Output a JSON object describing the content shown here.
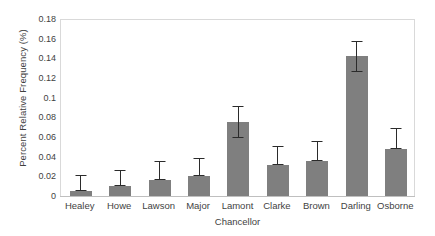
{
  "chart_data": {
    "type": "bar",
    "title": "",
    "xlabel": "Chancellor",
    "ylabel": "Percent Relative Frequency (%)",
    "categories": [
      "Healey",
      "Howe",
      "Lawson",
      "Major",
      "Lamont",
      "Clarke",
      "Brown",
      "Darling",
      "Osborne"
    ],
    "values": [
      0.005,
      0.01,
      0.016,
      0.02,
      0.075,
      0.032,
      0.036,
      0.142,
      0.048
    ],
    "error_low": [
      0.005,
      0.01,
      0.016,
      0.02,
      0.059,
      0.032,
      0.036,
      0.126,
      0.048
    ],
    "error_high": [
      0.021,
      0.026,
      0.036,
      0.039,
      0.092,
      0.051,
      0.056,
      0.158,
      0.069
    ],
    "ylim": [
      0,
      0.18
    ],
    "ytick_values": [
      0,
      0.02,
      0.04,
      0.06,
      0.08,
      0.1,
      0.12,
      0.14,
      0.16,
      0.18
    ],
    "ytick_labels": [
      "0",
      "0.02",
      "0.04",
      "0.06",
      "0.08",
      "0.1",
      "0.12",
      "0.14",
      "0.16",
      "0.18"
    ],
    "grid": false,
    "legend": null,
    "bar_color": "#7f7f7f",
    "errorbar_color": "#2b2b2b",
    "axis_color": "#d9d9d9"
  }
}
